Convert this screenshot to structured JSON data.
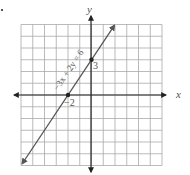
{
  "figure": {
    "equation_label": "−3x + 2y = 6",
    "x_axis_label": "x",
    "y_axis_label": "y",
    "y_intercept_label": "3",
    "x_intercept_label": "−2",
    "grid": {
      "x_min": -6,
      "x_max": 6,
      "y_min": -6,
      "y_max": 6,
      "step": 1
    },
    "line": {
      "slope": 1.5,
      "y_intercept": 3,
      "x_intercept": -2
    },
    "points": [
      {
        "x": -2,
        "y": 0
      },
      {
        "x": 0,
        "y": 3
      }
    ]
  }
}
